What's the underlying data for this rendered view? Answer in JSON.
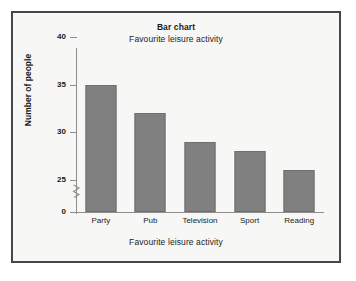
{
  "chart_data": {
    "type": "bar",
    "title": "Bar chart",
    "subtitle": "Favourite leisure activity",
    "xlabel": "Favourite leisure activity",
    "ylabel": "Number of people",
    "categories": [
      "Party",
      "Pub",
      "Television",
      "Sport",
      "Reading"
    ],
    "values": [
      35,
      32,
      29,
      28,
      26
    ],
    "ylim": [
      0,
      40
    ],
    "yticks": [
      0,
      25,
      30,
      35,
      40
    ],
    "ytick_labels": [
      "0",
      "25",
      "30",
      "35",
      "40"
    ],
    "axis_break": {
      "present": true,
      "between": [
        0,
        25
      ],
      "symbol": "zigzag"
    },
    "grid": false,
    "legend": false,
    "bar_color": "#808080",
    "bar_edge_color": "#6f6f6f",
    "axis_color": "#8d8d8d",
    "text_color": "#1b1b1b",
    "background_color": "#f7f7f5",
    "frame_color": "#474747"
  }
}
